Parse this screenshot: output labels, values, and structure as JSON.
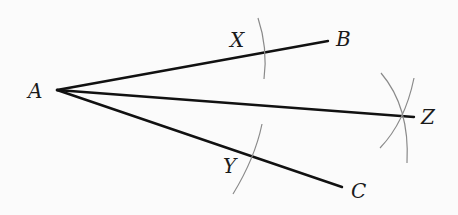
{
  "diagram": {
    "colors": {
      "background": "#fbfbfb",
      "ray": "#111111",
      "arc": "#8a8a8a",
      "label": "#1a1a1a"
    },
    "points": {
      "A": {
        "label": "A",
        "x": 57,
        "y": 90
      },
      "B": {
        "label": "B",
        "x": 328,
        "y": 41
      },
      "C": {
        "label": "C",
        "x": 342,
        "y": 187
      },
      "Z": {
        "label": "Z",
        "x": 414,
        "y": 117
      },
      "X": {
        "label": "X",
        "x": 261,
        "y": 54
      },
      "Y": {
        "label": "Y",
        "x": 252,
        "y": 152
      }
    },
    "rays": [
      {
        "from": "A",
        "to": "B"
      },
      {
        "from": "A",
        "to": "Z"
      },
      {
        "from": "A",
        "to": "C"
      }
    ],
    "arcs": [
      {
        "name": "arc-through-X",
        "center": "A"
      },
      {
        "name": "arc-through-Y",
        "center": "A"
      },
      {
        "name": "arc-from-X",
        "center": "X"
      },
      {
        "name": "arc-from-Y",
        "center": "Y"
      }
    ],
    "labels": {
      "A": "A",
      "B": "B",
      "C": "C",
      "X": "X",
      "Y": "Y",
      "Z": "Z"
    }
  }
}
